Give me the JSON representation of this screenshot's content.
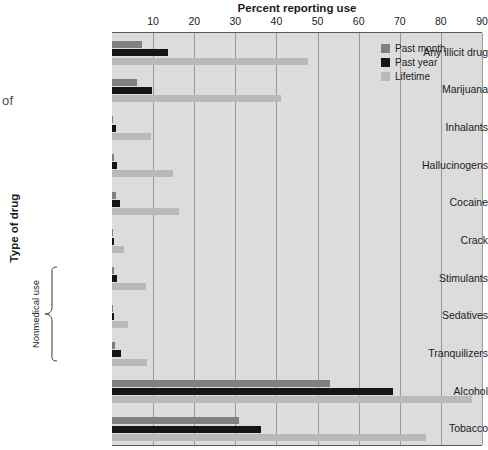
{
  "page_fragment": "of",
  "axes": {
    "x_title": "Percent reporting use",
    "y_title": "Type of drug",
    "group_bracket_label": "Nonmedical use"
  },
  "legend": {
    "items": [
      {
        "key": "past_month",
        "label": "Past month",
        "color": "#808080"
      },
      {
        "key": "past_year",
        "label": "Past year",
        "color": "#151515"
      },
      {
        "key": "lifetime",
        "label": "Lifetime",
        "color": "#b9b9b9"
      }
    ]
  },
  "colors": {
    "plot_background": "#dcdcdc",
    "gridline": "#9a9a9a",
    "axis": "#5a5a5a",
    "past_month": "#808080",
    "past_year": "#151515",
    "lifetime": "#b9b9b9"
  },
  "chart_data": {
    "type": "bar",
    "orientation": "horizontal",
    "title": "",
    "xlabel": "Percent reporting use",
    "ylabel": "Type of drug",
    "xlim": [
      0,
      90
    ],
    "xticks": [
      10,
      20,
      30,
      40,
      50,
      60,
      70,
      80,
      90
    ],
    "grid": true,
    "legend_position": "top-right",
    "categories": [
      "Any illicit drug",
      "Marijuana",
      "Inhalants",
      "Hallucinogens",
      "Cocaine",
      "Crack",
      "Stimulants",
      "Sedatives",
      "Tranquilizers",
      "Alcohol",
      "Tobacco"
    ],
    "bracketed_categories": [
      "Stimulants",
      "Sedatives",
      "Tranquilizers"
    ],
    "bracket_label": "Nonmedical use",
    "series": [
      {
        "name": "Past month",
        "key": "past_month",
        "values": [
          7.3,
          6.1,
          0.3,
          0.4,
          0.9,
          0.3,
          0.5,
          0.2,
          0.8,
          53.0,
          30.9
        ]
      },
      {
        "name": "Past year",
        "key": "past_year",
        "values": [
          13.6,
          9.8,
          0.9,
          1.3,
          2.0,
          0.6,
          1.2,
          0.4,
          2.1,
          68.3,
          36.3
        ]
      },
      {
        "name": "Lifetime",
        "key": "lifetime",
        "values": [
          47.7,
          41.0,
          9.5,
          14.9,
          16.3,
          2.9,
          8.2,
          3.9,
          8.5,
          87.6,
          76.4
        ]
      }
    ]
  }
}
